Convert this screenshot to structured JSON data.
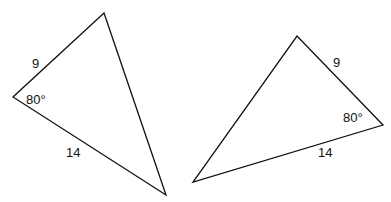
{
  "diagram": {
    "stroke_color": "#111111",
    "triangles": [
      {
        "name": "left-triangle",
        "points": "104,13 13,97 166,195",
        "labels": [
          {
            "text": "9",
            "x": 32,
            "y": 57
          },
          {
            "text": "80°",
            "x": 26,
            "y": 93
          },
          {
            "text": "14",
            "x": 66,
            "y": 146
          }
        ]
      },
      {
        "name": "right-triangle",
        "points": "297,36 383,125 193,182",
        "labels": [
          {
            "text": "9",
            "x": 333,
            "y": 56
          },
          {
            "text": "80°",
            "x": 343,
            "y": 111
          },
          {
            "text": "14",
            "x": 318,
            "y": 146
          }
        ]
      }
    ]
  }
}
